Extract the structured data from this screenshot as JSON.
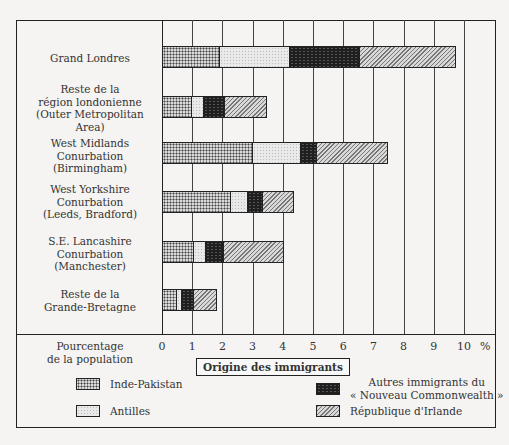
{
  "chart_data": {
    "type": "bar",
    "orientation": "horizontal",
    "stacked": true,
    "title": "",
    "xlabel": "Pourcentage de la population",
    "ylabel": "",
    "xlim": [
      0,
      10
    ],
    "x_unit": "%",
    "x_ticks": [
      "0",
      "1",
      "2",
      "3",
      "4",
      "5",
      "6",
      "7",
      "8",
      "9",
      "10"
    ],
    "grid": true,
    "legend_title": "Origine des immigrants",
    "legend_position": "bottom",
    "categories": [
      "Grand Londres",
      "Reste de la région londonienne (Outer Metropolitan Area)",
      "West Midlands Conurbation (Birmingham)",
      "West Yorkshire Conurbation (Leeds, Bradford)",
      "S.E. Lancashire Conurbation (Manchester)",
      "Reste de la Grande-Bretagne"
    ],
    "series": [
      {
        "name": "Inde-Pakistan",
        "values": [
          1.85,
          0.95,
          2.95,
          2.25,
          1.0,
          0.45
        ]
      },
      {
        "name": "Antilles",
        "values": [
          2.35,
          0.4,
          1.6,
          0.55,
          0.4,
          0.15
        ]
      },
      {
        "name": "Autres immigrants du « Nouveau Commonwealth »",
        "values": [
          2.3,
          0.7,
          0.55,
          0.5,
          0.6,
          0.4
        ]
      },
      {
        "name": "République d'Irlande",
        "values": [
          3.2,
          1.4,
          2.35,
          1.05,
          2.0,
          0.8
        ]
      }
    ],
    "totals": [
      9.7,
      3.45,
      7.45,
      4.35,
      4.0,
      1.8
    ]
  },
  "rows": [
    {
      "label": "Grand Londres"
    },
    {
      "label": "Reste de la\nrégion londonienne\n(Outer Metropolitan\nArea)"
    },
    {
      "label": "West Midlands\nConurbation\n(Birmingham)"
    },
    {
      "label": "West Yorkshire\nConurbation\n(Leeds, Bradford)"
    },
    {
      "label": "S.E. Lancashire\nConurbation\n(Manchester)"
    },
    {
      "label": "Reste de la\nGrande-Bretagne"
    }
  ],
  "axis": {
    "title": "Pourcentage\nde la population",
    "ticks": [
      "0",
      "1",
      "2",
      "3",
      "4",
      "5",
      "6",
      "7",
      "8",
      "9",
      "10"
    ],
    "unit": "%"
  },
  "legend": {
    "title": "Origine des immigrants",
    "items": [
      {
        "label": "Inde-Pakistan",
        "pattern": "pat-ip"
      },
      {
        "label": "Antilles",
        "pattern": "pat-ant"
      },
      {
        "label": "Autres immigrants du\n« Nouveau Commonwealth »",
        "pattern": "pat-aut"
      },
      {
        "label": "République d'Irlande",
        "pattern": "pat-irl"
      }
    ]
  },
  "colors": {
    "ink": "#222222",
    "paper": "#f5f4f2"
  }
}
